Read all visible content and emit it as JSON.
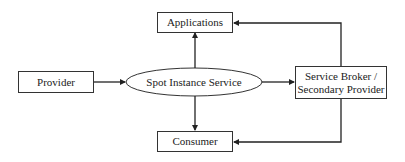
{
  "diagram": {
    "nodes": {
      "provider": {
        "label": "Provider",
        "shape": "rectangle"
      },
      "applications": {
        "label": "Applications",
        "shape": "rectangle"
      },
      "spot_instance_service": {
        "label": "Spot Instance Service",
        "shape": "ellipse"
      },
      "service_broker": {
        "label_line1": "Service Broker /",
        "label_line2": "Secondary Provider",
        "shape": "rectangle"
      },
      "consumer": {
        "label": "Consumer",
        "shape": "rectangle"
      }
    },
    "edges": [
      {
        "from": "Provider",
        "to": "Spot Instance Service"
      },
      {
        "from": "Spot Instance Service",
        "to": "Applications"
      },
      {
        "from": "Spot Instance Service",
        "to": "Consumer"
      },
      {
        "from": "Spot Instance Service",
        "to": "Service Broker / Secondary Provider"
      },
      {
        "from": "Service Broker / Secondary Provider",
        "to": "Applications"
      },
      {
        "from": "Service Broker / Secondary Provider",
        "to": "Consumer"
      }
    ],
    "colors": {
      "stroke": "#222222",
      "background": "#ffffff"
    }
  }
}
